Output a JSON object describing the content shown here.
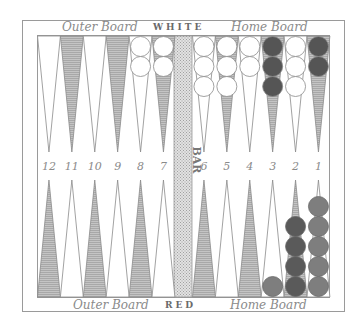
{
  "labels": {
    "top_left": "Outer Board",
    "top_center": "WHITE",
    "top_right": "Home Board",
    "bottom_left": "Outer Board",
    "bottom_center": "RED",
    "bottom_right": "Home Board",
    "bar": "BAR"
  },
  "colors": {
    "frame": "#9a9a9a",
    "shaded_point": "#b8b8b8",
    "light_point": "#ffffff",
    "bar": "#d4d4d4",
    "white_checker": "#ffffff",
    "dark_checker": "#555555",
    "red_checker_dark": "#5a5a5a",
    "red_checker_medium": "#7e7e7e"
  },
  "point_numbers": [
    "12",
    "11",
    "10",
    "9",
    "8",
    "7",
    "6",
    "5",
    "4",
    "3",
    "2",
    "1"
  ],
  "top_checkers": [
    {
      "point": "12",
      "count": 0,
      "color": ""
    },
    {
      "point": "11",
      "count": 0,
      "color": ""
    },
    {
      "point": "10",
      "count": 0,
      "color": ""
    },
    {
      "point": "9",
      "count": 0,
      "color": ""
    },
    {
      "point": "8",
      "count": 2,
      "color": "white"
    },
    {
      "point": "7",
      "count": 2,
      "color": "white"
    },
    {
      "point": "6",
      "count": 3,
      "color": "white"
    },
    {
      "point": "5",
      "count": 3,
      "color": "white"
    },
    {
      "point": "4",
      "count": 2,
      "color": "white"
    },
    {
      "point": "3",
      "count": 3,
      "color": "dark"
    },
    {
      "point": "2",
      "count": 3,
      "color": "white"
    },
    {
      "point": "1",
      "count": 2,
      "color": "dark"
    }
  ],
  "bottom_checkers": [
    {
      "point": "12",
      "count": 0,
      "color": ""
    },
    {
      "point": "11",
      "count": 0,
      "color": ""
    },
    {
      "point": "10",
      "count": 0,
      "color": ""
    },
    {
      "point": "9",
      "count": 0,
      "color": ""
    },
    {
      "point": "8",
      "count": 0,
      "color": ""
    },
    {
      "point": "7",
      "count": 0,
      "color": ""
    },
    {
      "point": "6",
      "count": 0,
      "color": ""
    },
    {
      "point": "5",
      "count": 0,
      "color": ""
    },
    {
      "point": "4",
      "count": 0,
      "color": ""
    },
    {
      "point": "3",
      "count": 1,
      "color": "red-medium"
    },
    {
      "point": "2",
      "count": 4,
      "color": "red-dark"
    },
    {
      "point": "1",
      "count": 5,
      "color": "red-medium"
    }
  ]
}
